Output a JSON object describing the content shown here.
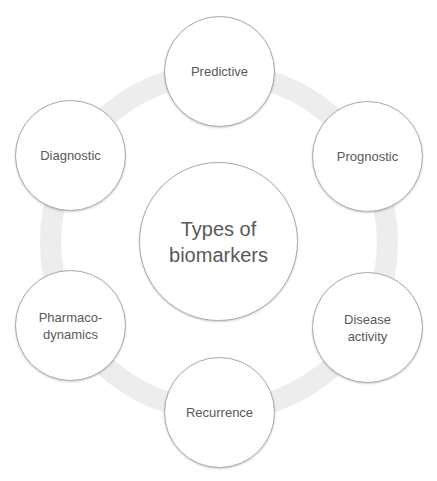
{
  "diagram": {
    "type": "radial-cycle",
    "center": {
      "label": "Types of\nbiomarkers"
    },
    "nodes": [
      {
        "id": "predictive",
        "label": "Predictive"
      },
      {
        "id": "prognostic",
        "label": "Prognostic"
      },
      {
        "id": "disease-activity",
        "label": "Disease\nactivity"
      },
      {
        "id": "recurrence",
        "label": "Recurrence"
      },
      {
        "id": "pharmacodynamics",
        "label": "Pharmaco-\ndynamics"
      },
      {
        "id": "diagnostic",
        "label": "Diagnostic"
      }
    ],
    "colors": {
      "ring": "#ededed",
      "node_fill": "#ffffff",
      "node_border": "#a9a9a9",
      "text": "#595959"
    }
  }
}
